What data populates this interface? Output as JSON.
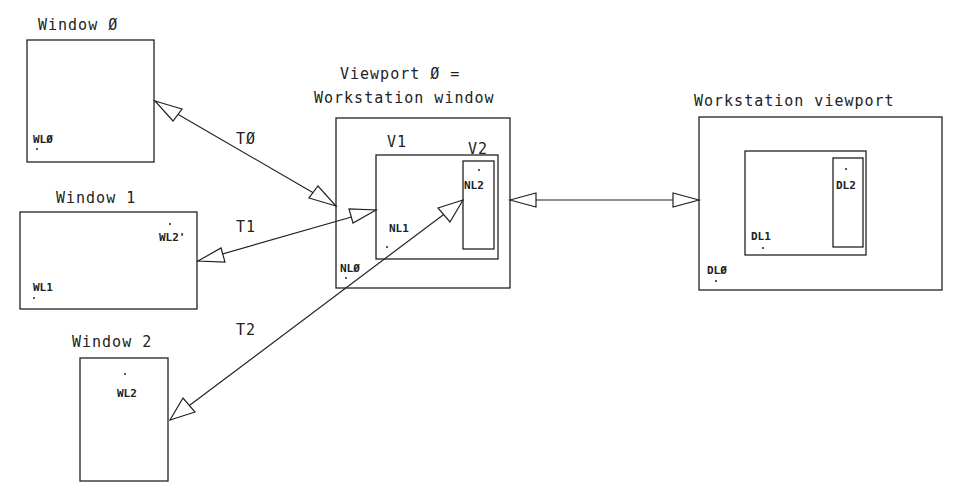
{
  "windows": [
    {
      "title": "Window Ø",
      "point_label": "WLØ"
    },
    {
      "title": "Window 1",
      "point_labels": [
        "WL2'",
        "WL1"
      ]
    },
    {
      "title": "Window 2",
      "point_label": "WL2"
    }
  ],
  "transforms": {
    "t0": "TØ",
    "t1": "T1",
    "t2": "T2"
  },
  "viewport0": {
    "title_line1": "Viewport Ø =",
    "title_line2": "Workstation window",
    "v1_label": "V1",
    "v2_label": "V2",
    "points": {
      "nl0": "NLØ",
      "nl1": "NL1",
      "nl2": "NL2"
    }
  },
  "workstation_viewport": {
    "title": "Workstation viewport",
    "points": {
      "dl0": "DLØ",
      "dl1": "DL1",
      "dl2": "DL2"
    }
  },
  "colors": {
    "ink": "#222222",
    "background": "#ffffff"
  }
}
